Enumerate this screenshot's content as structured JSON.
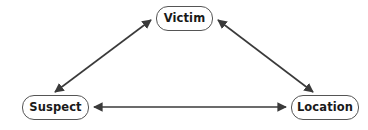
{
  "diagram": {
    "background_color": "#ffffff",
    "node_border_color": "#555555",
    "node_fill_color": "#ffffff",
    "edge_color": "#3a3a3a",
    "text_color": "#1a1a1a",
    "nodes": [
      {
        "id": "victim",
        "label": "Victim"
      },
      {
        "id": "suspect",
        "label": "Suspect"
      },
      {
        "id": "location",
        "label": "Location"
      }
    ],
    "edges": [
      {
        "id": "suspect-victim",
        "from": "Suspect",
        "to": "Victim",
        "direction": "bidirectional"
      },
      {
        "id": "victim-location",
        "from": "Victim",
        "to": "Location",
        "direction": "bidirectional"
      },
      {
        "id": "suspect-location",
        "from": "Suspect",
        "to": "Location",
        "direction": "bidirectional"
      }
    ]
  }
}
